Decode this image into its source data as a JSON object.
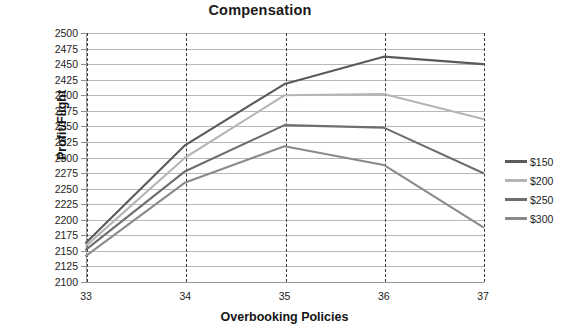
{
  "chart_data": {
    "type": "line",
    "title": "Compensation",
    "xlabel": "Overbooking Policies",
    "ylabel": "Profit/Flight",
    "categories": [
      33,
      34,
      35,
      36,
      37
    ],
    "x": [
      33,
      34,
      35,
      36,
      37
    ],
    "xlim": [
      33,
      37
    ],
    "ylim": [
      2100,
      2500
    ],
    "ytick_step": 25,
    "yticks": [
      2500,
      2475,
      2450,
      2425,
      2400,
      2375,
      2350,
      2325,
      2300,
      2275,
      2250,
      2225,
      2200,
      2175,
      2150,
      2125,
      2100
    ],
    "xticks": [
      33,
      34,
      35,
      36,
      37
    ],
    "grid": "horizontal",
    "legend_position": "right",
    "series": [
      {
        "name": "$150",
        "values": [
          2163,
          2320,
          2418,
          2462,
          2450
        ],
        "color": "#5a5a5a"
      },
      {
        "name": "$200",
        "values": [
          2158,
          2300,
          2400,
          2402,
          2362
        ],
        "color": "#b5b5b5"
      },
      {
        "name": "$250",
        "values": [
          2152,
          2278,
          2352,
          2348,
          2275
        ],
        "color": "#6e6e6e"
      },
      {
        "name": "$300",
        "values": [
          2142,
          2260,
          2318,
          2288,
          2188
        ],
        "color": "#8a8a8a"
      }
    ]
  },
  "colors": {
    "gridline": "#b8b8b8",
    "axis": "#9a9a9a",
    "dashed_vline": "#3a3a3a",
    "text": "#1d1d1d",
    "title": "#1a1a1a",
    "background": "#ffffff"
  }
}
